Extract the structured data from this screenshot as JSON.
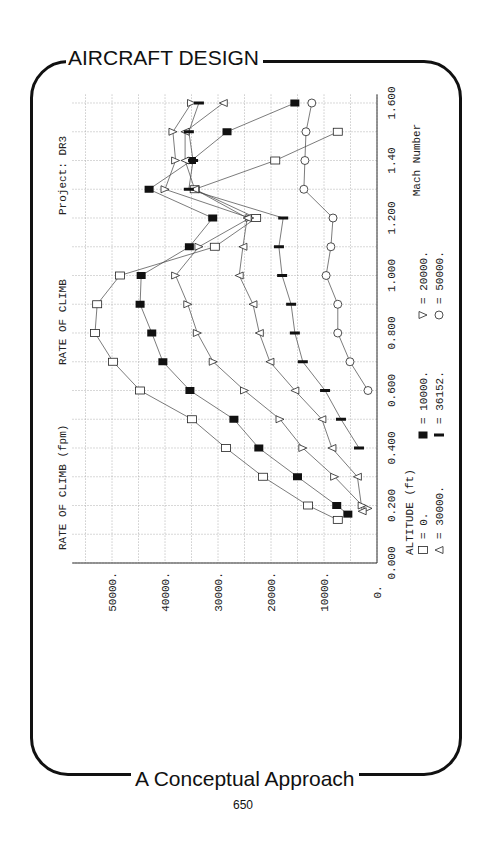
{
  "page": {
    "header_title": "AIRCRAFT DESIGN",
    "footer_title": "A Conceptual Approach",
    "page_number": "650"
  },
  "plot": {
    "ylabel_text": "RATE OF CLIMB (fpm)",
    "title_text": "RATE OF CLIMB",
    "project_text": "Project: DR3",
    "xlabel_text": "Mach Number",
    "legend_title": "ALTITUDE (ft)",
    "legend": [
      {
        "symbol": "open-square",
        "label": "= 0."
      },
      {
        "symbol": "filled-square",
        "label": "= 10000."
      },
      {
        "symbol": "open-triangle",
        "label": "= 20000."
      },
      {
        "symbol": "open-diamond",
        "label": "= 30000."
      },
      {
        "symbol": "filled-bar",
        "label": "= 36152."
      },
      {
        "symbol": "open-circle",
        "label": "= 50000."
      }
    ],
    "roc_ticks": [
      "50000.",
      "40000.",
      "30000.",
      "20000.",
      "10000.",
      "0."
    ],
    "mach_ticks": [
      "0.000",
      "0.200",
      "0.400",
      "0.600",
      "0.800",
      "1.000",
      "1.200",
      "1.40",
      "1.600"
    ]
  },
  "chart_data": {
    "type": "line",
    "title": "RATE OF CLIMB",
    "subtitle": "Project: DR3",
    "xlabel": "Mach Number",
    "ylabel": "RATE OF CLIMB (fpm)",
    "xlim": [
      0,
      1.6
    ],
    "ylim": [
      0,
      55000
    ],
    "x_ticks": [
      0.0,
      0.2,
      0.4,
      0.6,
      0.8,
      1.0,
      1.2,
      1.4,
      1.6
    ],
    "y_ticks": [
      0,
      10000,
      20000,
      30000,
      40000,
      50000
    ],
    "grid": true,
    "orientation": "rotated 90deg (Mach axis vertical, ROC axis horizontal)",
    "legend_title": "ALTITUDE (ft)",
    "series": [
      {
        "name": "0.",
        "marker": "open-square",
        "points": [
          [
            0.15,
            7400
          ],
          [
            0.2,
            13000
          ],
          [
            0.3,
            21500
          ],
          [
            0.4,
            28500
          ],
          [
            0.5,
            34900
          ],
          [
            0.6,
            44700
          ],
          [
            0.7,
            49800
          ],
          [
            0.8,
            53200
          ],
          [
            0.9,
            52800
          ],
          [
            1.0,
            48500
          ],
          [
            1.1,
            30600
          ],
          [
            1.2,
            22800
          ],
          [
            1.3,
            34400
          ],
          [
            1.4,
            19200
          ],
          [
            1.5,
            7400
          ]
        ]
      },
      {
        "name": "10000.",
        "marker": "filled-square",
        "points": [
          [
            0.17,
            5500
          ],
          [
            0.2,
            7600
          ],
          [
            0.3,
            15000
          ],
          [
            0.4,
            22300
          ],
          [
            0.5,
            27000
          ],
          [
            0.6,
            35300
          ],
          [
            0.7,
            40400
          ],
          [
            0.8,
            42500
          ],
          [
            0.9,
            44700
          ],
          [
            1.0,
            44500
          ],
          [
            1.1,
            35400
          ],
          [
            1.2,
            31000
          ],
          [
            1.3,
            43000
          ],
          [
            1.4,
            35000
          ],
          [
            1.5,
            28300
          ],
          [
            1.6,
            15500
          ]
        ]
      },
      {
        "name": "20000.",
        "marker": "open-triangle",
        "points": [
          [
            0.19,
            1700
          ],
          [
            0.2,
            2800
          ],
          [
            0.3,
            8000
          ],
          [
            0.4,
            14000
          ],
          [
            0.5,
            18300
          ],
          [
            0.6,
            25000
          ],
          [
            0.7,
            30900
          ],
          [
            0.8,
            33900
          ],
          [
            0.9,
            35700
          ],
          [
            1.0,
            38000
          ],
          [
            1.1,
            33600
          ],
          [
            1.2,
            24000
          ],
          [
            1.3,
            40000
          ],
          [
            1.4,
            38000
          ],
          [
            1.5,
            38500
          ],
          [
            1.6,
            35000
          ]
        ]
      },
      {
        "name": "30000.",
        "marker": "open-diamond",
        "points": [
          [
            0.18,
            2800
          ],
          [
            0.3,
            3700
          ],
          [
            0.4,
            8500
          ],
          [
            0.5,
            10400
          ],
          [
            0.6,
            15500
          ],
          [
            0.7,
            20200
          ],
          [
            0.8,
            22200
          ],
          [
            0.9,
            23400
          ],
          [
            1.0,
            26000
          ],
          [
            1.1,
            25300
          ],
          [
            1.2,
            24500
          ],
          [
            1.3,
            34400
          ],
          [
            1.4,
            36200
          ],
          [
            1.5,
            36200
          ],
          [
            1.6,
            29000
          ]
        ]
      },
      {
        "name": "36152.",
        "marker": "filled-bar",
        "points": [
          [
            0.4,
            3400
          ],
          [
            0.5,
            6800
          ],
          [
            0.6,
            9800
          ],
          [
            0.7,
            14000
          ],
          [
            0.8,
            15500
          ],
          [
            0.9,
            16200
          ],
          [
            1.0,
            17900
          ],
          [
            1.1,
            18500
          ],
          [
            1.2,
            17700
          ],
          [
            1.3,
            35500
          ],
          [
            1.4,
            34700
          ],
          [
            1.5,
            35500
          ],
          [
            1.6,
            33600
          ]
        ]
      },
      {
        "name": "50000.",
        "marker": "open-circle",
        "points": [
          [
            0.6,
            1700
          ],
          [
            0.7,
            5100
          ],
          [
            0.8,
            7400
          ],
          [
            0.9,
            7400
          ],
          [
            1.0,
            9600
          ],
          [
            1.1,
            8700
          ],
          [
            1.2,
            8300
          ],
          [
            1.3,
            13800
          ],
          [
            1.4,
            13600
          ],
          [
            1.5,
            13400
          ],
          [
            1.6,
            12300
          ]
        ]
      }
    ]
  }
}
